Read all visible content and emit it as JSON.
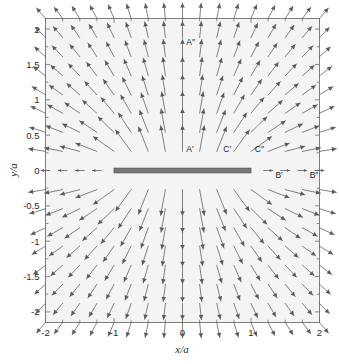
{
  "figure": {
    "type": "quiver-vector-field-plot",
    "background_color": "#ffffff",
    "plot_background_color": "#f4f4f4",
    "frame_color": "#707070",
    "arrow_color": "#5a5a5a",
    "plate_color": "#777777"
  },
  "axes": {
    "x_title": "x/a",
    "y_title": "y/a",
    "x_ticks": [
      "-2",
      "-1",
      "0",
      "1",
      "2"
    ],
    "x_tick_values": [
      -2,
      -1,
      0,
      1,
      2
    ],
    "y_ticks": [
      "2",
      "1.5",
      "1",
      "0.5",
      "0",
      "-0.5",
      "-1",
      "-1.5",
      "-2"
    ],
    "y_tick_values": [
      2,
      1.5,
      1,
      0.5,
      0,
      -0.5,
      -1,
      -1.5,
      -2
    ],
    "xlim": [
      -2,
      2
    ],
    "ylim": [
      -2.15,
      2.15
    ]
  },
  "plate": {
    "name": "charged-plate",
    "x_start": -1,
    "x_end": 1,
    "y": 0
  },
  "point_labels": [
    {
      "text": "A″",
      "x": 0.02,
      "y": 1.82
    },
    {
      "text": "A′",
      "x": 0.02,
      "y": 0.3
    },
    {
      "text": "C′",
      "x": 0.56,
      "y": 0.3
    },
    {
      "text": "C″",
      "x": 1.02,
      "y": 0.3
    },
    {
      "text": "B′",
      "x": 1.32,
      "y": -0.06
    },
    {
      "text": "B″",
      "x": 1.82,
      "y": -0.06
    }
  ],
  "chart_data": {
    "type": "scatter",
    "title": "",
    "xlabel": "x/a",
    "ylabel": "y/a",
    "xlim": [
      -2,
      2
    ],
    "ylim": [
      -2.15,
      2.15
    ],
    "grid": false,
    "legend": "none",
    "field_description": "Electric field vectors around a uniformly charged flat plate of half-width a lying along y=0 from x=-1 to x=1. Field points away from the plate (up above, down below) and wraps around the edges.",
    "grid_nx": 17,
    "grid_ny": 17,
    "x_grid": [
      -2,
      -1.75,
      -1.5,
      -1.25,
      -1,
      -0.75,
      -0.5,
      -0.25,
      0,
      0.25,
      0.5,
      0.75,
      1,
      1.25,
      1.5,
      1.75,
      2
    ],
    "y_grid": [
      -2.15,
      -1.88,
      -1.61,
      -1.34,
      -1.07,
      -0.81,
      -0.54,
      -0.27,
      0,
      0.27,
      0.54,
      0.81,
      1.07,
      1.34,
      1.61,
      1.88,
      2.15
    ],
    "annotations": [
      "A″",
      "A′",
      "C′",
      "C″",
      "B′",
      "B″"
    ]
  }
}
